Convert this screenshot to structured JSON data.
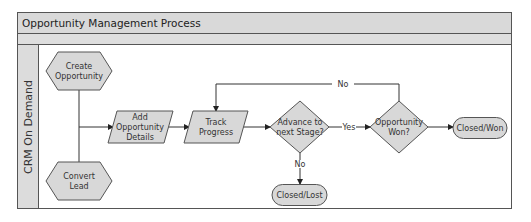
{
  "diagram": {
    "title": "Opportunity Management Process",
    "lane": "CRM On Demand",
    "colors": {
      "band": "#d9d9d9",
      "node_fill": "#d8d8d8",
      "stroke": "#555555",
      "line": "#333333"
    },
    "nodes": {
      "create": {
        "shape": "hexagon",
        "lines": [
          "Create",
          "Opportunity"
        ]
      },
      "convert": {
        "shape": "hexagon",
        "lines": [
          "Convert",
          "Lead"
        ]
      },
      "add": {
        "shape": "parallelogram",
        "lines": [
          "Add",
          "Opportunity",
          "Details"
        ]
      },
      "track": {
        "shape": "parallelogram",
        "lines": [
          "Track",
          "Progress"
        ]
      },
      "advance": {
        "shape": "diamond",
        "lines": [
          "Advance to",
          "next Stage?"
        ]
      },
      "won": {
        "shape": "diamond",
        "lines": [
          "Opportunity",
          "Won?"
        ]
      },
      "closed_won": {
        "shape": "terminator",
        "lines": [
          "Closed/Won"
        ]
      },
      "closed_lost": {
        "shape": "terminator",
        "lines": [
          "Closed/Lost"
        ]
      }
    },
    "edges": {
      "yes": "Yes",
      "no_down": "No",
      "no_loop": "No"
    }
  }
}
